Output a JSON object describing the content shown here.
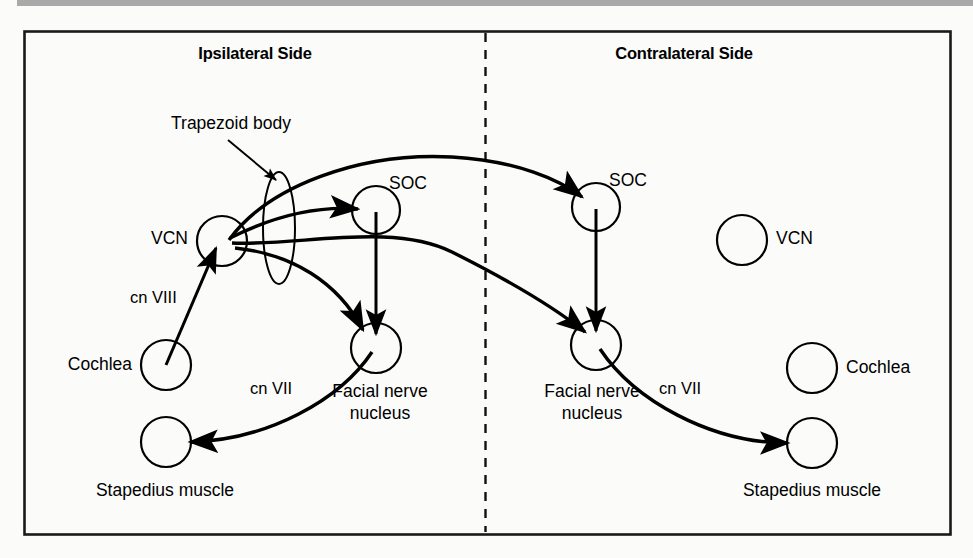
{
  "figure": {
    "kind": "acoustic-reflex-arc-diagram",
    "headers": {
      "ipsilateral": "Ipsilateral Side",
      "contralateral": "Contralateral Side"
    },
    "annotation": {
      "trapezoid_body": "Trapezoid body"
    },
    "nodes": {
      "ipsi_vcn": "VCN",
      "ipsi_soc": "SOC",
      "ipsi_fnn_line1": "Facial nerve",
      "ipsi_fnn_line2": "nucleus",
      "ipsi_cochlea": "Cochlea",
      "ipsi_stapedius": "Stapedius muscle",
      "contra_vcn": "VCN",
      "contra_soc": "SOC",
      "contra_fnn_line1": "Facial nerve",
      "contra_fnn_line2": "nucleus",
      "contra_cochlea": "Cochlea",
      "contra_stapedius": "Stapedius muscle"
    },
    "nerves": {
      "cn8": "cn VIII",
      "cn7_ipsi": "cn VII",
      "cn7_contra": "cn VII"
    },
    "colors": {
      "ink": "#000000",
      "background": "#fbfbfa",
      "top_bar": "#a9a9a9",
      "border": "#1a1a1a"
    }
  }
}
